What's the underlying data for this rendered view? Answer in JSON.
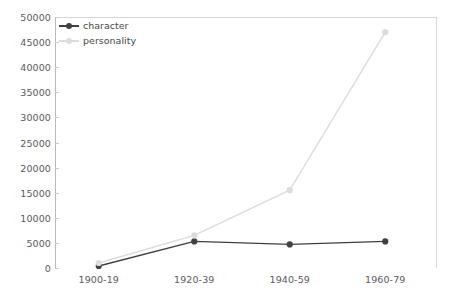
{
  "chart_data": {
    "type": "line",
    "title": "",
    "subtitle": "",
    "xlabel": "",
    "ylabel": "",
    "categories": [
      "1900-19",
      "1920-39",
      "1940-59",
      "1960-79"
    ],
    "series": [
      {
        "name": "character",
        "color": "#404040",
        "marker": "circle",
        "values": [
          400,
          5300,
          4700,
          5300
        ]
      },
      {
        "name": "personality",
        "color": "#dcdcdc",
        "marker": "circle",
        "values": [
          1000,
          6500,
          15500,
          47000
        ]
      }
    ],
    "ylim": [
      0,
      50000
    ],
    "yticks": [
      0,
      5000,
      10000,
      15000,
      20000,
      25000,
      30000,
      35000,
      40000,
      45000,
      50000
    ],
    "ytick_labels": [
      "0",
      "5000",
      "10000",
      "15000",
      "20000",
      "25000",
      "30000",
      "35000",
      "40000",
      "45000",
      "50000"
    ],
    "grid": false,
    "legend_position": "top-left",
    "axis_color": "#b9b9b9",
    "tick_label_color": "#5a5a5a",
    "background": "#ffffff"
  },
  "legend": {
    "items": [
      {
        "label": "character"
      },
      {
        "label": "personality"
      }
    ]
  }
}
